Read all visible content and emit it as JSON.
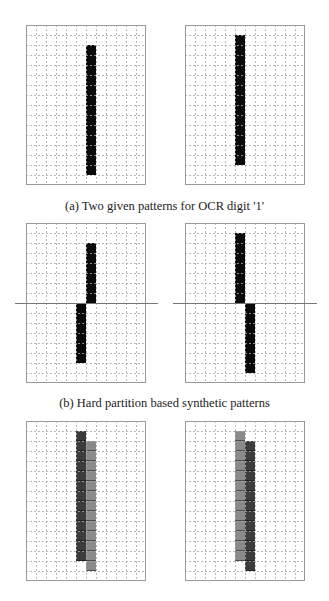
{
  "figure": {
    "grid": {
      "cols": 12,
      "rows": 16,
      "cell_px": 10
    },
    "colors": {
      "black": "#0a0a0a",
      "dark_grey": "#3c3c3c",
      "light_grey": "#8a8a8a",
      "grid_line": "#a8a8a8",
      "frame": "#9a9a9a"
    },
    "rows": [
      {
        "id": "a",
        "caption": "(a) Two given patterns for OCR digit '1'",
        "panels": [
          {
            "x": 26,
            "y": 25,
            "partition": null,
            "bars": [
              {
                "col": 6,
                "row_start": 2,
                "row_end": 14,
                "shade": "black"
              }
            ]
          },
          {
            "x": 185,
            "y": 25,
            "partition": null,
            "bars": [
              {
                "col": 5,
                "row_start": 1,
                "row_end": 13,
                "shade": "black"
              }
            ]
          }
        ]
      },
      {
        "id": "b",
        "caption": "(b) Hard partition based synthetic patterns",
        "panels": [
          {
            "x": 26,
            "y": 223,
            "partition": {
              "row": 8,
              "x1": 15,
              "x2": 158
            },
            "bars": [
              {
                "col": 6,
                "row_start": 2,
                "row_end": 7,
                "shade": "black"
              },
              {
                "col": 5,
                "row_start": 8,
                "row_end": 13,
                "shade": "black"
              }
            ]
          },
          {
            "x": 185,
            "y": 223,
            "partition": {
              "row": 8,
              "x1": 173,
              "x2": 317
            },
            "bars": [
              {
                "col": 5,
                "row_start": 1,
                "row_end": 7,
                "shade": "black"
              },
              {
                "col": 6,
                "row_start": 8,
                "row_end": 14,
                "shade": "black"
              }
            ]
          }
        ]
      },
      {
        "id": "c",
        "caption": "",
        "panels": [
          {
            "x": 26,
            "y": 421,
            "partition": null,
            "bars": [
              {
                "col": 5,
                "row_start": 1,
                "row_end": 13,
                "shade": "dark_grey"
              },
              {
                "col": 6,
                "row_start": 2,
                "row_end": 14,
                "shade": "light_grey"
              }
            ]
          },
          {
            "x": 185,
            "y": 421,
            "partition": null,
            "bars": [
              {
                "col": 5,
                "row_start": 1,
                "row_end": 13,
                "shade": "light_grey"
              },
              {
                "col": 6,
                "row_start": 2,
                "row_end": 14,
                "shade": "dark_grey"
              }
            ]
          }
        ]
      }
    ]
  },
  "captions": {
    "a": "(a) Two given patterns for OCR digit '1'",
    "b": "(b) Hard partition based synthetic patterns"
  }
}
